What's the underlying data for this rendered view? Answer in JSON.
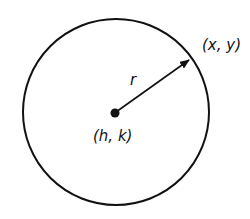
{
  "diagram": {
    "type": "circle-equation",
    "labels": {
      "point_on_circle": "(x, y)",
      "radius": "r",
      "center": "(h, k)"
    },
    "colors": {
      "stroke": "#111111",
      "background": "#ffffff"
    }
  }
}
